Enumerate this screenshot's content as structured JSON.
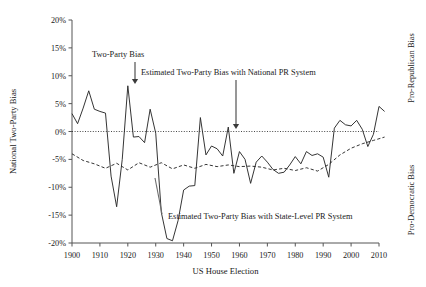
{
  "chart_data": {
    "type": "line",
    "title": "",
    "xlabel": "US House Election",
    "ylabel": "National Two-Party Bias",
    "xlim": [
      1898,
      2014
    ],
    "ylim": [
      -20,
      20
    ],
    "grid": false,
    "legend_position": "inline-annotations",
    "xticks": [
      1900,
      1910,
      1920,
      1930,
      1940,
      1950,
      1960,
      1970,
      1980,
      1990,
      2000,
      2010
    ],
    "xticklabels": [
      "1900",
      "1910",
      "1920",
      "1930",
      "1940",
      "1950",
      "1960",
      "1970",
      "1980",
      "1990",
      "2000",
      "2010"
    ],
    "yticks": [
      20,
      15,
      10,
      5,
      0,
      -5,
      -10,
      -15,
      -20
    ],
    "yticklabels": [
      "20%",
      "15%",
      "10%",
      "5%",
      "0%",
      "-5%",
      "-10%",
      "-15%",
      "-20%"
    ],
    "zero_line": 0,
    "side_labels": {
      "top": "Pro-Republican Bias",
      "bottom": "Pro-Democratic Bias"
    },
    "annotations": [
      {
        "name": "two-party-bias",
        "text": "Two-Party Bias",
        "arrow_to_year": 1920,
        "arrow_to_value": 8.2
      },
      {
        "name": "national-pr",
        "text": "Estimated Two-Party Bias with National PR System",
        "arrow_to_year": 1962,
        "arrow_to_value": 0.3
      },
      {
        "name": "state-level-pr",
        "text": "Estimated Two-Party Bias with State-Level PR System",
        "arrow_to_year": 1950,
        "arrow_to_value": -6.2
      }
    ],
    "series": [
      {
        "name": "Two-Party Bias",
        "style": "solid",
        "x": [
          1900,
          1902,
          1904,
          1906,
          1908,
          1910,
          1912,
          1914,
          1916,
          1918,
          1920,
          1922,
          1924,
          1926,
          1928,
          1930,
          1932,
          1934,
          1936,
          1938,
          1940,
          1942,
          1944,
          1946,
          1948,
          1950,
          1952,
          1954,
          1956,
          1958,
          1960,
          1962,
          1964,
          1966,
          1968,
          1970,
          1972,
          1974,
          1976,
          1978,
          1980,
          1982,
          1984,
          1986,
          1988,
          1990,
          1992,
          1994,
          1996,
          1998,
          2000,
          2002,
          2004,
          2006,
          2008,
          2010,
          2012
        ],
        "y": [
          3.2,
          1.4,
          4.2,
          7.3,
          4.0,
          3.6,
          3.3,
          -8.0,
          -13.5,
          -5.0,
          8.2,
          -1.0,
          -0.9,
          -2.0,
          4.0,
          -0.3,
          -14.5,
          -19.2,
          -19.6,
          -16.0,
          -10.5,
          -9.8,
          -9.7,
          2.5,
          -4.2,
          -2.6,
          -3.1,
          -4.4,
          0.8,
          -7.5,
          -3.6,
          -5.0,
          -9.3,
          -5.5,
          -4.4,
          -5.5,
          -6.8,
          -7.5,
          -7.3,
          -6.0,
          -4.5,
          -5.8,
          -3.6,
          -4.3,
          -4.0,
          -4.6,
          -8.2,
          0.6,
          2.0,
          1.2,
          1.0,
          2.0,
          0.4,
          -2.7,
          -0.5,
          4.5,
          3.6
        ]
      },
      {
        "name": "Estimated Two-Party Bias with State-Level PR System",
        "style": "dashed",
        "x": [
          1900,
          1904,
          1908,
          1912,
          1916,
          1920,
          1924,
          1928,
          1932,
          1936,
          1940,
          1944,
          1948,
          1952,
          1956,
          1960,
          1964,
          1968,
          1972,
          1976,
          1980,
          1984,
          1988,
          1992,
          1996,
          2000,
          2004,
          2008,
          2012
        ],
        "y": [
          -4.0,
          -5.2,
          -5.8,
          -6.6,
          -5.7,
          -6.9,
          -5.6,
          -6.4,
          -5.6,
          -6.7,
          -6.0,
          -6.6,
          -5.9,
          -6.3,
          -6.0,
          -6.3,
          -6.2,
          -6.4,
          -6.9,
          -6.6,
          -7.0,
          -6.5,
          -7.1,
          -5.9,
          -4.2,
          -3.0,
          -2.2,
          -1.6,
          -1.0
        ]
      }
    ]
  }
}
